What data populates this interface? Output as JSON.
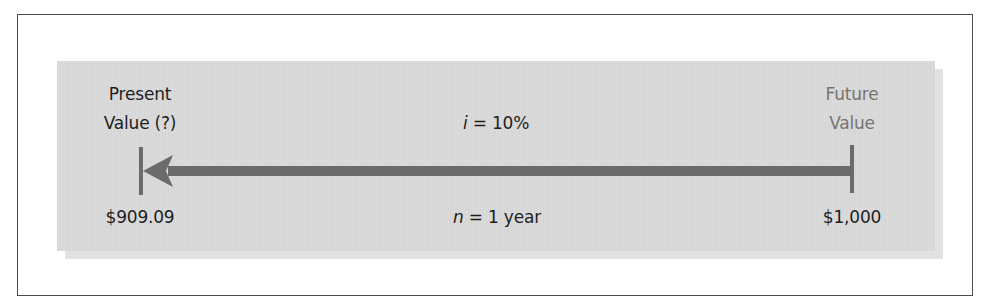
{
  "diagram": {
    "type": "time-value-of-money-timeline",
    "left_end": {
      "title_line1": "Present",
      "title_line2": "Value (?)",
      "amount": "$909.09"
    },
    "right_end": {
      "title_line1": "Future",
      "title_line2": "Value",
      "amount": "$1,000"
    },
    "rate": {
      "variable": "i",
      "equals_text": " = 10%"
    },
    "period": {
      "variable": "n",
      "equals_text": " = 1 year"
    },
    "arrow_direction": "right-to-left",
    "colors": {
      "panel": "#d9d9d9",
      "panel_shadow": "#e2e2e2",
      "arrow": "#6b6b6b",
      "text_dark": "#1e1e1e",
      "text_gray": "#747474",
      "frame_border": "#4a4a4a"
    }
  }
}
